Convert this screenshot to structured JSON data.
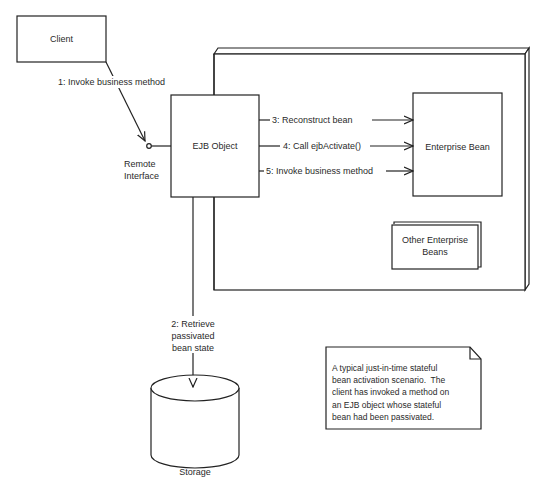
{
  "diagram": {
    "nodes": {
      "client": {
        "label": "Client"
      },
      "ejb_object": {
        "label": "EJB Object"
      },
      "enterprise_bean": {
        "label": "Enterprise Bean"
      },
      "other_beans": {
        "label_line1": "Other Enterprise",
        "label_line2": "Beans"
      },
      "storage": {
        "label": "Storage"
      },
      "remote_interface": {
        "label_line1": "Remote",
        "label_line2": "Interface"
      }
    },
    "edges": [
      {
        "label": "1: Invoke business method"
      },
      {
        "label_line1": "2: Retrieve",
        "label_line2": "passivated",
        "label_line3": "bean state"
      },
      {
        "label": "3: Reconstruct bean"
      },
      {
        "label": "4: Call ejbActivate()"
      },
      {
        "label": "5: Invoke business method"
      }
    ],
    "note": {
      "lines": [
        "A typical just-in-time stateful",
        "bean activation scenario.  The",
        "client has invoked a method on",
        "an EJB object whose stateful",
        "bean had been passivated."
      ]
    },
    "colors": {
      "stroke": "#222222",
      "background": "#ffffff",
      "text": "#2a2a2a"
    }
  }
}
